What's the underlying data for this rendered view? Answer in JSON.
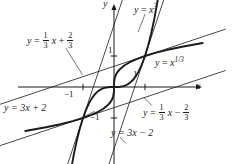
{
  "figure": {
    "kind": "math-graph",
    "width": 238,
    "height": 164,
    "background": "#ffffff",
    "ink": "#1a1a1a",
    "axes": {
      "x_axis_label": "x",
      "y_axis_label": "y",
      "origin_px": [
        114,
        87
      ],
      "unit_px": 31,
      "xlim": [
        -3.7,
        3.6
      ],
      "ylim": [
        -2.5,
        2.8
      ],
      "grid": false,
      "ticks": {
        "x": [
          {
            "value": -1,
            "label": "−1",
            "side": "below"
          },
          {
            "value": 1,
            "label": "1",
            "side": "above"
          }
        ],
        "y": [
          {
            "value": 1,
            "label": "1",
            "side": "right"
          },
          {
            "value": -1,
            "label": "−1",
            "side": "left"
          }
        ]
      }
    },
    "labels": {
      "cubic": {
        "lhs": "y",
        "eq": "=",
        "rhs_base": "x",
        "rhs_exp": "3",
        "text": "y = x^3"
      },
      "cube_root": {
        "lhs": "y",
        "eq": "=",
        "rhs_base": "x",
        "rhs_exp": "1/3",
        "text": "y = x^(1/3)"
      },
      "tangent_cubic_upper": {
        "text": "y = 3x + 2",
        "lhs": "y",
        "eq": "=",
        "slope": "3",
        "var": "x",
        "sign": "+",
        "intercept": "2"
      },
      "tangent_cubic_lower": {
        "text": "y = 3x − 2",
        "lhs": "y",
        "eq": "=",
        "slope": "3",
        "var": "x",
        "sign": "−",
        "intercept": "2"
      },
      "tangent_root_upper": {
        "text": "y = (1/3)x + 2/3",
        "lhs": "y",
        "eq": "=",
        "slope_num": "1",
        "slope_den": "3",
        "var": "x",
        "sign": "+",
        "int_num": "2",
        "int_den": "3"
      },
      "tangent_root_lower": {
        "text": "y = (1/3)x − 2/3",
        "lhs": "y",
        "eq": "=",
        "slope_num": "1",
        "slope_den": "3",
        "var": "x",
        "sign": "−",
        "int_num": "2",
        "int_den": "3"
      }
    }
  },
  "chart_data": {
    "type": "line",
    "title": "",
    "xlabel": "x",
    "ylabel": "y",
    "xlim": [
      -3.7,
      3.6
    ],
    "ylim": [
      -2.5,
      2.8
    ],
    "grid": false,
    "legend_position": "inline-annotations",
    "xticks": [
      -1,
      1
    ],
    "xticklabels": [
      "−1",
      "1"
    ],
    "yticks": [
      -1,
      1
    ],
    "yticklabels": [
      "−1",
      "1"
    ],
    "annotations": [
      {
        "text": "y = x^3",
        "x": 0.95,
        "y": 2.55
      },
      {
        "text": "y = x^(1/3)",
        "x": 2.25,
        "y": 0.75
      },
      {
        "text": "y = (1/3)x + 2/3",
        "x": -2.55,
        "y": 1.45
      },
      {
        "text": "y = (1/3)x − 2/3",
        "x": 1.05,
        "y": -1.25
      },
      {
        "text": "y = 3x + 2",
        "x": -3.45,
        "y": -0.85
      },
      {
        "text": "y = 3x − 2",
        "x": 0.45,
        "y": -2.0
      }
    ],
    "intersections": [
      {
        "x": -1,
        "y": -1
      },
      {
        "x": 0,
        "y": 0
      },
      {
        "x": 1,
        "y": 1
      }
    ],
    "series": [
      {
        "name": "y = x^3",
        "role": "curve",
        "style": "thick",
        "linewidth": 1.9,
        "color": "#1a1a1a",
        "expression": "x**3",
        "x": [
          -1.42,
          -1.3,
          -1.2,
          -1.1,
          -1.0,
          -0.9,
          -0.8,
          -0.7,
          -0.6,
          -0.5,
          -0.4,
          -0.3,
          -0.2,
          -0.1,
          0.0,
          0.1,
          0.2,
          0.3,
          0.4,
          0.5,
          0.6,
          0.7,
          0.8,
          0.9,
          1.0,
          1.1,
          1.2,
          1.3,
          1.42
        ],
        "y": [
          -2.86,
          -2.197,
          -1.728,
          -1.331,
          -1.0,
          -0.729,
          -0.512,
          -0.343,
          -0.216,
          -0.125,
          -0.064,
          -0.027,
          -0.008,
          -0.001,
          0.0,
          0.001,
          0.008,
          0.027,
          0.064,
          0.125,
          0.216,
          0.343,
          0.512,
          0.729,
          1.0,
          1.331,
          1.728,
          2.197,
          2.86
        ]
      },
      {
        "name": "y = x^(1/3)",
        "role": "curve",
        "style": "thick",
        "linewidth": 1.9,
        "color": "#1a1a1a",
        "expression": "cbrt(x)",
        "x": [
          -2.86,
          -2.197,
          -1.728,
          -1.331,
          -1.0,
          -0.729,
          -0.512,
          -0.343,
          -0.216,
          -0.125,
          -0.064,
          -0.027,
          -0.008,
          -0.001,
          0.0,
          0.001,
          0.008,
          0.027,
          0.064,
          0.125,
          0.216,
          0.343,
          0.512,
          0.729,
          1.0,
          1.331,
          1.728,
          2.197,
          2.86
        ],
        "y": [
          -1.42,
          -1.3,
          -1.2,
          -1.1,
          -1.0,
          -0.9,
          -0.8,
          -0.7,
          -0.6,
          -0.5,
          -0.4,
          -0.3,
          -0.2,
          -0.1,
          0.0,
          0.1,
          0.2,
          0.3,
          0.4,
          0.5,
          0.6,
          0.7,
          0.8,
          0.9,
          1.0,
          1.1,
          1.2,
          1.3,
          1.42
        ]
      },
      {
        "name": "y = 3x + 2",
        "role": "tangent",
        "style": "thin",
        "linewidth": 0.8,
        "color": "#1a1a1a",
        "slope": 3,
        "intercept": 2,
        "tangent_point": [
          -1,
          -1
        ],
        "tangent_to": "y = x^3"
      },
      {
        "name": "y = 3x − 2",
        "role": "tangent",
        "style": "thin",
        "linewidth": 0.8,
        "color": "#1a1a1a",
        "slope": 3,
        "intercept": -2,
        "tangent_point": [
          1,
          1
        ],
        "tangent_to": "y = x^3"
      },
      {
        "name": "y = (1/3)x + 2/3",
        "role": "tangent",
        "style": "thin",
        "linewidth": 0.8,
        "color": "#1a1a1a",
        "slope": 0.3333,
        "intercept": 0.6667,
        "tangent_point": [
          1,
          1
        ],
        "tangent_to": "y = x^(1/3)"
      },
      {
        "name": "y = (1/3)x − 2/3",
        "role": "tangent",
        "style": "thin",
        "linewidth": 0.8,
        "color": "#1a1a1a",
        "slope": 0.3333,
        "intercept": -0.6667,
        "tangent_point": [
          -1,
          -1
        ],
        "tangent_to": "y = x^(1/3)"
      }
    ],
    "leaders": [
      {
        "from": [
          -1.55,
          1.25
        ],
        "to": [
          -1.02,
          0.4
        ],
        "for": "y = (1/3)x + 2/3"
      },
      {
        "from": [
          -0.62,
          -0.78
        ],
        "to": [
          -0.95,
          -0.95
        ],
        "for": "y = 3x + 2"
      },
      {
        "from": [
          1.22,
          -0.6
        ],
        "to": [
          0.95,
          -0.32
        ],
        "for": "y = (1/3)x − 2/3"
      },
      {
        "from": [
          0.38,
          -1.82
        ],
        "to": [
          0.2,
          -1.62
        ],
        "for": "y = 3x − 2"
      },
      {
        "from": [
          1.0,
          2.35
        ],
        "to": [
          0.78,
          1.78
        ],
        "for": "y = x^3"
      }
    ]
  }
}
